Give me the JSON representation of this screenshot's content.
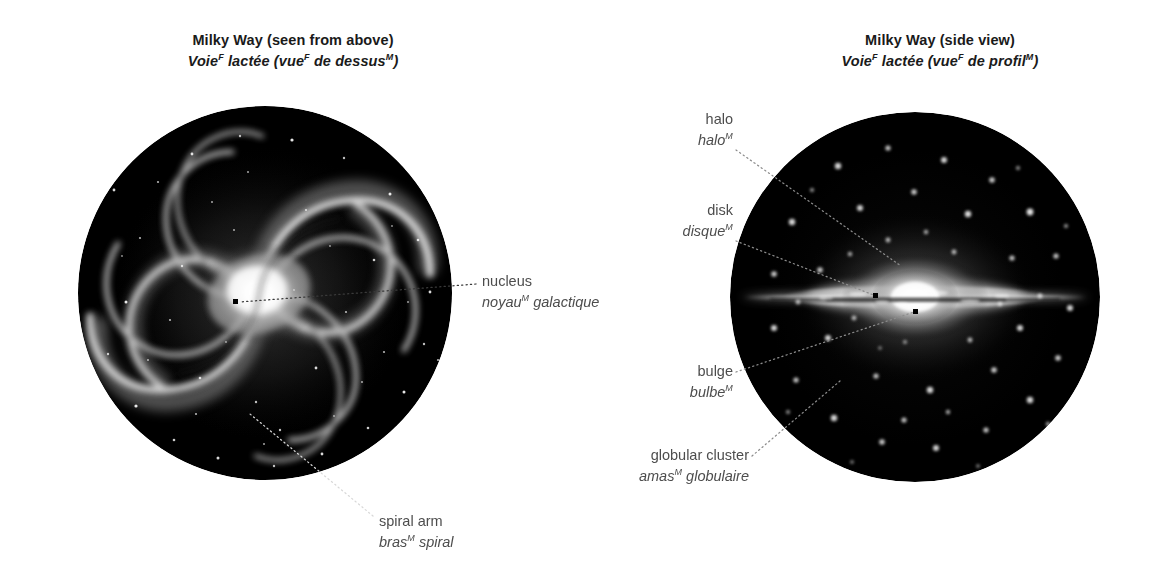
{
  "figure": {
    "panels": [
      {
        "id": "top-view",
        "title_en": "Milky Way (seen from above)",
        "title_fr_parts": [
          "Voie",
          "F",
          " lactée (vue",
          "F",
          " de dessus",
          "M",
          ")"
        ],
        "title_fr_plain": "Voieᴹ lactée (vueᶠ de dessusᴹ)"
      },
      {
        "id": "side-view",
        "title_en": "Milky Way (side view)",
        "title_fr_parts": [
          "Voie",
          "F",
          " lactée (vue",
          "F",
          " de profil",
          "M",
          ")"
        ],
        "title_fr_plain": "Voie lactée (vue de profil)"
      }
    ]
  },
  "titles": {
    "left": {
      "en": "Milky Way (seen from above)",
      "fr_a": "Voie",
      "fr_a_gm": "F",
      "fr_b": " lactée (vue",
      "fr_b_gm": "F",
      "fr_c": " de dessus",
      "fr_c_gm": "M",
      "fr_d": ")"
    },
    "right": {
      "en": "Milky Way (side view)",
      "fr_a": "Voie",
      "fr_a_gm": "F",
      "fr_b": " lactée (vue",
      "fr_b_gm": "F",
      "fr_c": " de profil",
      "fr_c_gm": "M",
      "fr_d": ")"
    }
  },
  "callouts": {
    "nucleus": {
      "en": "nucleus",
      "fr_a": "noyau",
      "fr_gm": "M",
      "fr_b": " galactique",
      "panel": "top-view"
    },
    "spiral_arm": {
      "en": "spiral arm",
      "fr_a": "bras",
      "fr_gm": "M",
      "fr_b": " spiral",
      "panel": "top-view"
    },
    "halo": {
      "en": "halo",
      "fr_a": "halo",
      "fr_gm": "M",
      "fr_b": "",
      "panel": "side-view"
    },
    "disk": {
      "en": "disk",
      "fr_a": "disque",
      "fr_gm": "M",
      "fr_b": "",
      "panel": "side-view"
    },
    "bulge": {
      "en": "bulge",
      "fr_a": "bulbe",
      "fr_gm": "M",
      "fr_b": "",
      "panel": "side-view"
    },
    "globular_cluster": {
      "en": "globular cluster",
      "fr_a": "amas",
      "fr_gm": "M",
      "fr_b": " globulaire",
      "panel": "side-view"
    }
  },
  "colors": {
    "background": "#ffffff",
    "title_text": "#1a1a1a",
    "label_text": "#4d4d4d",
    "space_black": "#000000",
    "star_white": "#ffffff",
    "leader_dark": "#3a3a3a",
    "leader_light": "#d8d8d8"
  }
}
